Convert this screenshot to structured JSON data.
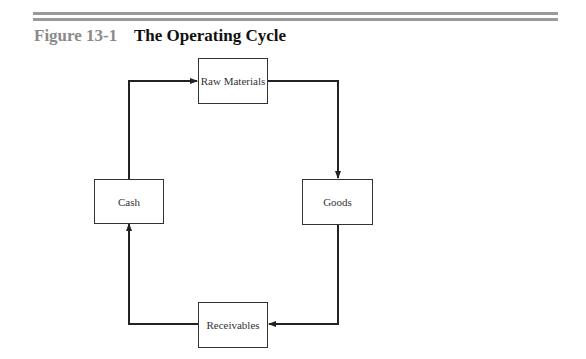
{
  "figure": {
    "number": "Figure 13-1",
    "title": "The Operating Cycle"
  },
  "diagram": {
    "type": "cycle",
    "nodes": [
      {
        "id": "raw_materials",
        "label": "Raw Materials"
      },
      {
        "id": "goods",
        "label": "Goods"
      },
      {
        "id": "receivables",
        "label": "Receivables"
      },
      {
        "id": "cash",
        "label": "Cash"
      }
    ],
    "edges": [
      {
        "from": "raw_materials",
        "to": "goods"
      },
      {
        "from": "goods",
        "to": "receivables"
      },
      {
        "from": "receivables",
        "to": "cash"
      },
      {
        "from": "cash",
        "to": "raw_materials"
      }
    ],
    "line_color": "#222222",
    "rule_color": "#9a9a9a"
  }
}
